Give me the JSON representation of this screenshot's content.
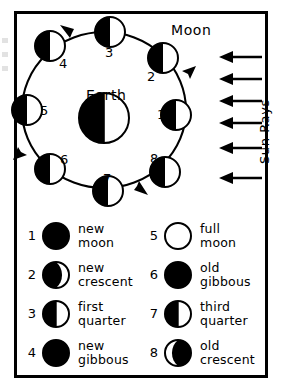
{
  "figure": {
    "title_text_present": false,
    "center_body": {
      "name": "Earth",
      "label": "Earth"
    },
    "orbiting_body": {
      "name": "Moon",
      "label": "Moon"
    },
    "sun_rays_label": "Sun Rays",
    "sun_rays_arrow_count": 6,
    "orbit_direction": "counter-clockwise",
    "colors": {
      "ink": "#000000",
      "paper": "#ffffff",
      "lit_side": "#ffffff",
      "dark_side": "#000000"
    }
  },
  "orbit_positions": [
    {
      "number": "1",
      "phase": "new moon",
      "angle_deg": 0,
      "lit_side": "right"
    },
    {
      "number": "2",
      "phase": "new crescent",
      "angle_deg": 45,
      "lit_side": "right"
    },
    {
      "number": "3",
      "phase": "first quarter",
      "angle_deg": 90,
      "lit_side": "right"
    },
    {
      "number": "4",
      "phase": "new gibbous",
      "angle_deg": 135,
      "lit_side": "right"
    },
    {
      "number": "5",
      "phase": "full moon",
      "angle_deg": 180,
      "lit_side": "right"
    },
    {
      "number": "6",
      "phase": "old gibbous",
      "angle_deg": 225,
      "lit_side": "right"
    },
    {
      "number": "7",
      "phase": "third quarter",
      "angle_deg": 270,
      "lit_side": "right"
    },
    {
      "number": "8",
      "phase": "old crescent",
      "angle_deg": 315,
      "lit_side": "right"
    }
  ],
  "legend": {
    "left_column": [
      {
        "number": "1",
        "line1": "new",
        "line2": "moon",
        "icon": "moon-new"
      },
      {
        "number": "2",
        "line1": "new",
        "line2": "crescent",
        "icon": "moon-waxing-crescent"
      },
      {
        "number": "3",
        "line1": "first",
        "line2": "quarter",
        "icon": "moon-first-quarter"
      },
      {
        "number": "4",
        "line1": "new",
        "line2": "gibbous",
        "icon": "moon-waxing-gibbous"
      }
    ],
    "right_column": [
      {
        "number": "5",
        "line1": "full",
        "line2": "moon",
        "icon": "moon-full"
      },
      {
        "number": "6",
        "line1": "old",
        "line2": "gibbous",
        "icon": "moon-waning-gibbous"
      },
      {
        "number": "7",
        "line1": "third",
        "line2": "quarter",
        "icon": "moon-third-quarter"
      },
      {
        "number": "8",
        "line1": "old",
        "line2": "crescent",
        "icon": "moon-waning-crescent"
      }
    ]
  }
}
